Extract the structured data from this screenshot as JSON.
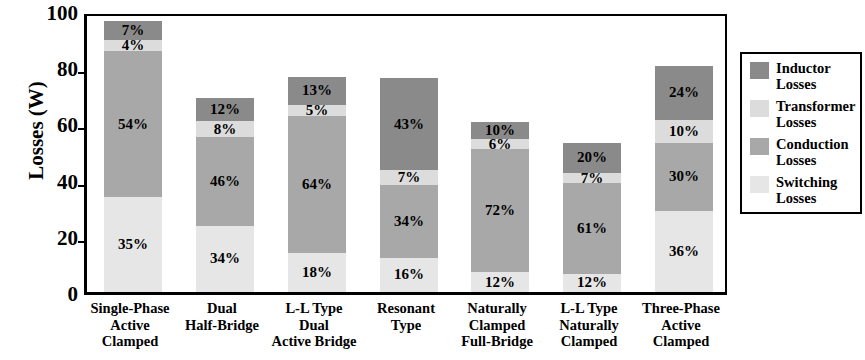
{
  "chart_data": {
    "type": "bar",
    "subtype": "stacked-bar",
    "title": "",
    "xlabel": "",
    "ylabel": "Losses (W)",
    "ylim": [
      0,
      100
    ],
    "yticks": [
      0,
      20,
      40,
      60,
      80,
      100
    ],
    "ytick_labels": [
      "0",
      "20",
      "40",
      "60",
      "80",
      "100"
    ],
    "grid": false,
    "legend_position": "right-outside",
    "units": "W",
    "categories": [
      "Single-Phase Active Clamped",
      "Dual Half-Bridge",
      "L-L Type Dual Active Bridge",
      "Resonant Type",
      "Naturally Clamped Full-Bridge",
      "L-L Type Naturally Clamped",
      "Three-Phase Active Clamped"
    ],
    "category_lines": [
      [
        "Single-Phase",
        "Active",
        "Clamped"
      ],
      [
        "Dual",
        "Half-Bridge"
      ],
      [
        "L-L Type",
        "Dual",
        "Active Bridge"
      ],
      [
        "Resonant",
        "Type"
      ],
      [
        "Naturally",
        "Clamped",
        "Full-Bridge"
      ],
      [
        "L-L Type",
        "Naturally",
        "Clamped"
      ],
      [
        "Three-Phase",
        "Active",
        "Clamped"
      ]
    ],
    "totals": [
      96.4,
      69.0,
      76.5,
      76.0,
      60.5,
      53.0,
      80.5
    ],
    "series": [
      {
        "name": "Switching Losses",
        "color": "#e6e6e6",
        "percent_labels": [
          "35%",
          "34%",
          "18%",
          "16%",
          "12%",
          "12%",
          "36%"
        ],
        "percents": [
          35,
          34,
          18,
          16,
          12,
          12,
          36
        ],
        "values": [
          33.7,
          23.5,
          13.8,
          12.2,
          7.3,
          6.4,
          29.0
        ]
      },
      {
        "name": "Conduction Losses",
        "color": "#a8a8a8",
        "percent_labels": [
          "54%",
          "46%",
          "64%",
          "34%",
          "72%",
          "61%",
          "30%"
        ],
        "percents": [
          54,
          46,
          64,
          34,
          72,
          61,
          30
        ],
        "values": [
          52.1,
          31.7,
          49.0,
          25.8,
          43.6,
          32.3,
          24.2
        ]
      },
      {
        "name": "Transformer Losses",
        "color": "#dcdcdc",
        "percent_labels": [
          "4%",
          "8%",
          "5%",
          "7%",
          "6%",
          "7%",
          "10%"
        ],
        "percents": [
          4,
          8,
          5,
          7,
          6,
          7,
          10
        ],
        "values": [
          3.9,
          5.5,
          3.8,
          5.3,
          3.6,
          3.7,
          8.1
        ]
      },
      {
        "name": "Inductor Losses",
        "color": "#8a8a8a",
        "percent_labels": [
          "7%",
          "12%",
          "13%",
          "43%",
          "10%",
          "20%",
          "24%"
        ],
        "percents": [
          7,
          12,
          13,
          43,
          10,
          20,
          24
        ],
        "values": [
          6.7,
          8.3,
          9.9,
          32.7,
          6.1,
          10.6,
          19.3
        ]
      }
    ]
  },
  "legend": {
    "items": [
      {
        "label_line1": "Inductor",
        "label_line2": "Losses",
        "color": "#8a8a8a",
        "swatch_name": "legend-swatch-inductor"
      },
      {
        "label_line1": "Transformer",
        "label_line2": "Losses",
        "color": "#dcdcdc",
        "swatch_name": "legend-swatch-transformer"
      },
      {
        "label_line1": "Conduction",
        "label_line2": "Losses",
        "color": "#a8a8a8",
        "swatch_name": "legend-swatch-conduction"
      },
      {
        "label_line1": "Switching",
        "label_line2": "Losses",
        "color": "#e6e6e6",
        "swatch_name": "legend-swatch-switching"
      }
    ]
  }
}
